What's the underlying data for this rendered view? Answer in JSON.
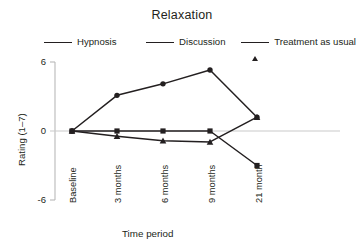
{
  "chart_data": {
    "type": "line",
    "title": "Relaxation",
    "xlabel": "Time period",
    "ylabel": "Rating (1–7)",
    "categories": [
      "Baseline",
      "3 months",
      "6 months",
      "9 months",
      "21 month"
    ],
    "ylim": [
      -6,
      6
    ],
    "yticks": [
      6,
      0,
      -6
    ],
    "ytick_labels": [
      "6",
      "0",
      "-6"
    ],
    "grid": false,
    "zero_line": true,
    "legend_position": "top",
    "series": [
      {
        "name": "Hypnosis",
        "marker": "circle",
        "color": "#231f20",
        "values": [
          0,
          3.1,
          4.1,
          5.3,
          1.2
        ]
      },
      {
        "name": "Discussion",
        "marker": "square",
        "color": "#231f20",
        "values": [
          0,
          0,
          0,
          0,
          -3.0
        ]
      },
      {
        "name": "Treatment as usual",
        "marker": "triangle",
        "color": "#231f20",
        "values": [
          0,
          -0.45,
          -0.85,
          -0.95,
          1.2
        ]
      }
    ]
  },
  "legend": {
    "items": [
      {
        "label": "Hypnosis",
        "marker": "circle-marker"
      },
      {
        "label": "Discussion",
        "marker": "square-marker"
      },
      {
        "label": "Treatment as usual",
        "marker": "triangle-marker"
      }
    ]
  },
  "axes": {
    "y_ticks": [
      {
        "label": "6"
      },
      {
        "label": "0"
      },
      {
        "label": "-6"
      }
    ],
    "x_ticks": [
      {
        "label": "Baseline"
      },
      {
        "label": "3 months"
      },
      {
        "label": "6 months"
      },
      {
        "label": "9 months"
      },
      {
        "label": "21 month"
      }
    ],
    "y_axis_title": "Rating (1–7)",
    "x_axis_title": "Time period"
  },
  "colors": {
    "ink": "#231f20",
    "axis": "#b9b9b9",
    "zero_line": "#c9c9c9",
    "background": "#ffffff"
  }
}
